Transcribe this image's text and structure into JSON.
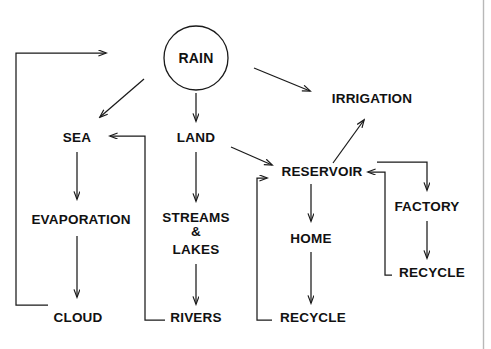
{
  "diagram": {
    "stroke_color": "#1a1a1a",
    "text_color": "#111111",
    "background_color": "#ffffff",
    "border_color": "#b8b8b8",
    "nodes": {
      "rain": "RAIN",
      "sea": "SEA",
      "land": "LAND",
      "irrigation": "IRRIGATION",
      "evaporation": "EVAPORATION",
      "streams_line1": "STREAMS",
      "streams_line2": "&",
      "streams_line3": "LAKES",
      "reservoir": "RESERVOIR",
      "home": "HOME",
      "factory": "FACTORY",
      "cloud": "CLOUD",
      "rivers": "RIVERS",
      "recycle_center": "RECYCLE",
      "recycle_right": "RECYCLE"
    },
    "edges": [
      {
        "from": "RAIN",
        "to": "SEA",
        "style": "diagonal-arrow"
      },
      {
        "from": "RAIN",
        "to": "LAND",
        "style": "vertical-arrow"
      },
      {
        "from": "RAIN",
        "to": "IRRIGATION",
        "style": "diagonal-arrow"
      },
      {
        "from": "SEA",
        "to": "EVAPORATION",
        "style": "vertical-arrow"
      },
      {
        "from": "EVAPORATION",
        "to": "CLOUD",
        "style": "vertical-arrow"
      },
      {
        "from": "CLOUD",
        "to": "RAIN",
        "style": "elbow-feedback"
      },
      {
        "from": "LAND",
        "to": "STREAMS & LAKES",
        "style": "vertical-arrow"
      },
      {
        "from": "LAND",
        "to": "RESERVOIR",
        "style": "diagonal-arrow"
      },
      {
        "from": "STREAMS & LAKES",
        "to": "RIVERS",
        "style": "vertical-arrow"
      },
      {
        "from": "RIVERS",
        "to": "SEA",
        "style": "elbow-feedback"
      },
      {
        "from": "RESERVOIR",
        "to": "IRRIGATION",
        "style": "diagonal-arrow"
      },
      {
        "from": "RESERVOIR",
        "to": "HOME",
        "style": "vertical-arrow"
      },
      {
        "from": "HOME",
        "to": "RECYCLE",
        "style": "vertical-arrow"
      },
      {
        "from": "RECYCLE",
        "to": "RESERVOIR",
        "style": "elbow-feedback"
      },
      {
        "from": "RESERVOIR",
        "to": "FACTORY",
        "style": "elbow-arrow"
      },
      {
        "from": "FACTORY",
        "to": "RECYCLE",
        "style": "vertical-arrow"
      },
      {
        "from": "RECYCLE",
        "to": "RESERVOIR",
        "style": "elbow-feedback"
      }
    ]
  }
}
